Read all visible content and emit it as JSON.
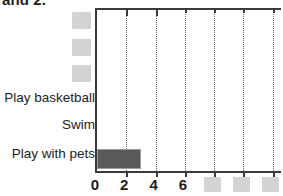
{
  "caption_fragment": "and 2.",
  "chart_data": {
    "type": "bar",
    "orientation": "horizontal",
    "title": "",
    "xlabel": "",
    "ylabel": "",
    "grid": true,
    "legend": false,
    "xlim": [
      0,
      12.7
    ],
    "categories": [
      "[redacted]",
      "[redacted]",
      "[redacted]",
      "Play basketball",
      "Swim",
      "Play with pets"
    ],
    "values": [
      null,
      null,
      null,
      0,
      0,
      3
    ],
    "xticks": [
      0,
      2,
      4,
      6,
      8,
      10,
      12
    ],
    "xtick_labels": [
      "0",
      "2",
      "4",
      "6",
      "[redacted]",
      "[redacted]",
      "[redacted]"
    ],
    "gridline_positions": [
      2,
      4,
      6,
      8,
      10,
      12
    ],
    "bar_color": "#5a5a5a",
    "bar_edge_color": "#9b9b9b",
    "axis_color": "#3a3a3a",
    "grid_color": "#6a6a6a",
    "redaction_color": "#c9c9c9"
  },
  "y_labels": {
    "redacted_rows": [
      {
        "top": 12,
        "left": 72,
        "width": 19,
        "height": 17
      },
      {
        "top": 39,
        "left": 72,
        "width": 19,
        "height": 17
      },
      {
        "top": 65,
        "left": 72,
        "width": 19,
        "height": 17
      }
    ],
    "visible_rows": [
      {
        "text": "Play basketball",
        "top": 90
      },
      {
        "text": "Swim",
        "top": 117
      },
      {
        "text": "Play with pets",
        "top": 146
      }
    ]
  },
  "x_axis": {
    "numeric_labels": [
      {
        "text": "0",
        "value": 0
      },
      {
        "text": "2",
        "value": 2
      },
      {
        "text": "4",
        "value": 4
      },
      {
        "text": "6",
        "value": 6
      }
    ],
    "redacted_labels": [
      {
        "value": 8,
        "width": 17,
        "height": 15
      },
      {
        "value": 10,
        "width": 17,
        "height": 15
      },
      {
        "value": 12,
        "width": 17,
        "height": 15
      }
    ]
  },
  "bars": [
    {
      "category": "Play with pets",
      "value": 3,
      "top": 147,
      "height": 20
    }
  ]
}
